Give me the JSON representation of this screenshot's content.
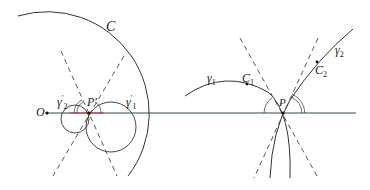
{
  "figure": {
    "left": {
      "labels": {
        "circle_C": "C",
        "origin": "O",
        "point": "P",
        "point_prime": "′",
        "gamma1": "γ",
        "gamma1_sub": "1",
        "gamma1_sup": "′",
        "gamma2": "γ",
        "gamma2_sub": "2",
        "gamma2_sup": "′"
      }
    },
    "right": {
      "labels": {
        "gamma1": "γ",
        "gamma1_sub": "1",
        "gamma2": "γ",
        "gamma2_sub": "2",
        "c1": "C",
        "c1_sub": "1",
        "c2": "C",
        "c2_sub": "2",
        "point": "P"
      }
    },
    "colors": {
      "stroke": "#333333",
      "axis": "#2a4a4a",
      "highlight": "#cc3333"
    }
  }
}
